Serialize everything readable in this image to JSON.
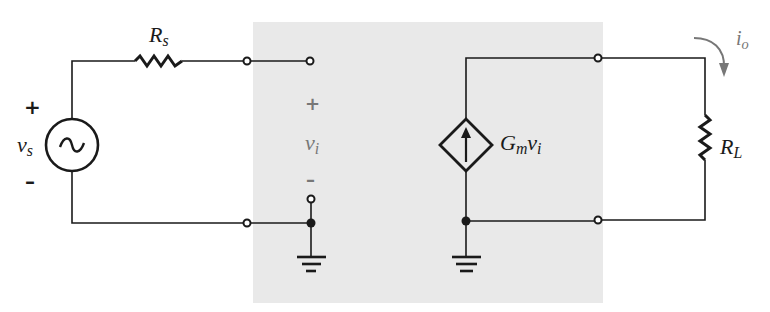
{
  "diagram": {
    "colors": {
      "wire": "#1a1a1a",
      "shaded_region": "#e9e9e9",
      "label_gray": "#777777",
      "arrow_gray": "#777777"
    },
    "source": {
      "symbol": "~",
      "label_main": "v",
      "label_sub": "s",
      "plus": "+",
      "minus": "–"
    },
    "source_resistor": {
      "label_main": "R",
      "label_sub": "s"
    },
    "input": {
      "label_main": "v",
      "label_sub": "i",
      "plus": "+",
      "minus": "–"
    },
    "dependent_source": {
      "label_main": "G",
      "label_sub": "m",
      "label_main2": "v",
      "label_sub2": "i",
      "direction": "up"
    },
    "output_current": {
      "label_main": "i",
      "label_sub": "o"
    },
    "load_resistor": {
      "label_main": "R",
      "label_sub": "L"
    }
  }
}
